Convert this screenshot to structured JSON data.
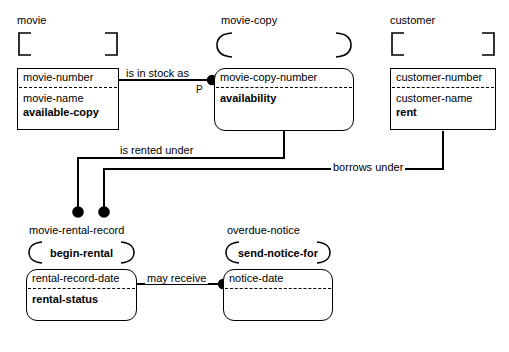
{
  "diagram": {
    "stroke_color": "#000000",
    "background_color": "#ffffff"
  },
  "entities": [
    {
      "id": "movie",
      "name": "movie",
      "shape": "square",
      "decoration": "square-bracket",
      "decoration_label": "",
      "identifier": "movie-number",
      "attributes": [
        {
          "label": "movie-name",
          "bold": false
        },
        {
          "label": "available-copy",
          "bold": true
        }
      ]
    },
    {
      "id": "movie-copy",
      "name": "movie-copy",
      "shape": "round",
      "decoration": "arc",
      "decoration_label": "",
      "identifier": "movie-copy-number",
      "attributes": [
        {
          "label": "availability",
          "bold": true
        }
      ]
    },
    {
      "id": "customer",
      "name": "customer",
      "shape": "square",
      "decoration": "square-bracket",
      "decoration_label": "",
      "identifier": "customer-number",
      "attributes": [
        {
          "label": "customer-name",
          "bold": false
        },
        {
          "label": "rent",
          "bold": true
        }
      ]
    },
    {
      "id": "movie-rental-record",
      "name": "movie-rental-record",
      "shape": "round",
      "decoration": "arc",
      "decoration_label": "begin-rental",
      "identifier": "rental-record-date",
      "attributes": [
        {
          "label": "rental-status",
          "bold": true
        }
      ]
    },
    {
      "id": "overdue-notice",
      "name": "overdue-notice",
      "shape": "round",
      "decoration": "arc",
      "decoration_label": "send-notice-for",
      "identifier": "notice-date",
      "attributes": []
    }
  ],
  "relationships": [
    {
      "id": "is-in-stock-as",
      "label": "is in stock as",
      "marker": "P",
      "from": "movie",
      "to": "movie-copy"
    },
    {
      "id": "is-rented-under",
      "label": "is rented under",
      "marker": "",
      "from": "movie-copy",
      "to": "movie-rental-record"
    },
    {
      "id": "borrows-under",
      "label": "borrows under",
      "marker": "",
      "from": "customer",
      "to": "movie-rental-record"
    },
    {
      "id": "may-receive",
      "label": "may receive",
      "marker": "",
      "from": "movie-rental-record",
      "to": "overdue-notice"
    }
  ]
}
